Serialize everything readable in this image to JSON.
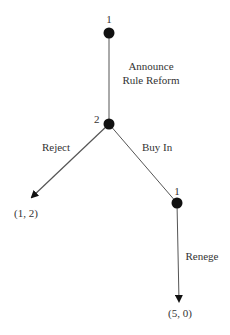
{
  "diagram": {
    "type": "game-tree",
    "colors": {
      "line": "#555555",
      "node": "#111111",
      "text": "#333333"
    },
    "nodes": [
      {
        "id": "n1",
        "player": "1",
        "x": 109,
        "y": 33
      },
      {
        "id": "n2",
        "player": "2",
        "x": 109,
        "y": 124
      },
      {
        "id": "n3",
        "player": "1",
        "x": 177,
        "y": 203
      }
    ],
    "edges": [
      {
        "from": "n1",
        "to": "n2",
        "label": "Announce Rule Reform",
        "label_lines": [
          "Announce",
          "Rule Reform"
        ]
      },
      {
        "from": "n2",
        "to": "payoff_left",
        "label": "Reject"
      },
      {
        "from": "n2",
        "to": "n3",
        "label": "Buy In"
      },
      {
        "from": "n3",
        "to": "payoff_bottom",
        "label": "Renege"
      }
    ],
    "payoffs": [
      {
        "id": "payoff_left",
        "value": "(1, 2)"
      },
      {
        "id": "payoff_bottom",
        "value": "(5, 0)"
      }
    ]
  }
}
